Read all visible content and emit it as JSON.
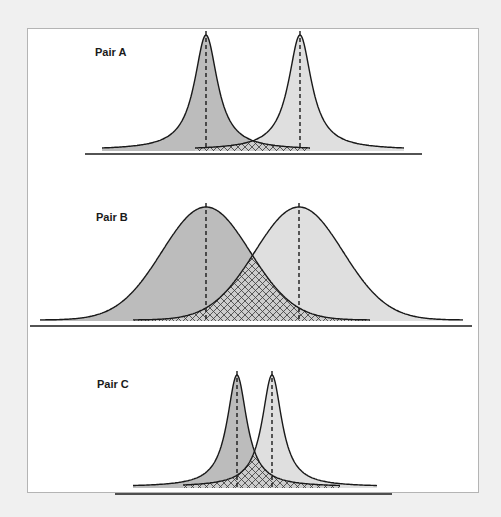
{
  "colors": {
    "background": "#f0f0f0",
    "panel": "#ffffff",
    "panel_border": "#b4b4b4",
    "left_fill": "#bcbcbc",
    "right_fill": "#dfdfdf",
    "overlap_fill": "#cdcdcd",
    "hatch": "#3a3a3a",
    "curve": "#1a1a1a",
    "baseline": "#1a1a1a"
  },
  "pairs": [
    {
      "id": "A",
      "label": "Pair A",
      "label_pos": [
        95,
        46
      ],
      "shape": "peaked",
      "baseline": {
        "x1": 85,
        "x2": 422,
        "y": 154
      },
      "tail_y": 150,
      "peak_y": 35,
      "mark_top": 31,
      "left": {
        "mean": 206,
        "x_start": 102,
        "x_end": 310,
        "scale": 14
      },
      "right": {
        "mean": 300,
        "x_start": 195,
        "x_end": 404,
        "scale": 14
      }
    },
    {
      "id": "B",
      "label": "Pair B",
      "label_pos": [
        96,
        211
      ],
      "shape": "gaussian",
      "baseline": {
        "x1": 30,
        "x2": 472,
        "y": 326
      },
      "tail_y": 320,
      "peak_y": 207,
      "mark_top": 203,
      "left": {
        "mean": 206,
        "x_start": 40,
        "x_end": 370,
        "scale": 44
      },
      "right": {
        "mean": 299,
        "x_start": 133,
        "x_end": 463,
        "scale": 44
      }
    },
    {
      "id": "C",
      "label": "Pair C",
      "label_pos": [
        97,
        378
      ],
      "shape": "peaked",
      "baseline": {
        "x1": 115,
        "x2": 392,
        "y": 494
      },
      "tail_y": 487,
      "peak_y": 375,
      "mark_top": 371,
      "left": {
        "mean": 237,
        "x_start": 133,
        "x_end": 340,
        "scale": 12
      },
      "right": {
        "mean": 272,
        "x_start": 183,
        "x_end": 377,
        "scale": 12
      }
    }
  ]
}
